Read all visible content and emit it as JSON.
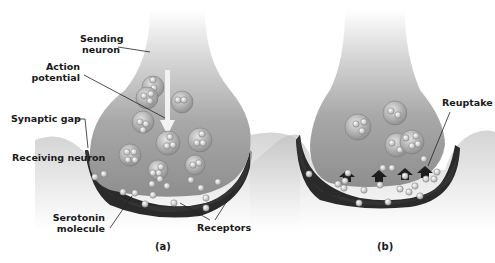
{
  "figure": {
    "panel_a": {
      "caption": "(a)",
      "labels": {
        "sending_neuron": [
          "Sending",
          "neuron"
        ],
        "action_potential": [
          "Action",
          "potential"
        ],
        "synaptic_gap": "Synaptic gap",
        "receiving_neuron": "Receiving neuron",
        "serotonin_molecule": [
          "Serotonin",
          "molecule"
        ],
        "receptors": "Receptors"
      }
    },
    "panel_b": {
      "caption": "(b)",
      "labels": {
        "reuptake": "Reuptake"
      }
    },
    "colors": {
      "background": "#ffffff",
      "sending_neuron_fill": "#9a9a9a",
      "receiving_neuron_fill": "#2e2e2e",
      "vesicle_fill": "#c8c8c8",
      "molecule_fill": "#e8e8e8",
      "label_text": "#1a1a1a"
    }
  }
}
